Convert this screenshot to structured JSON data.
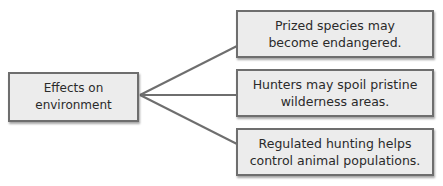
{
  "diagram": {
    "type": "tree-map",
    "root": {
      "label": "Effects on\nenvironment"
    },
    "branches": [
      {
        "label": "Prized species may\nbecome endangered."
      },
      {
        "label": "Hunters may spoil pristine\nwilderness areas."
      },
      {
        "label": "Regulated hunting helps\ncontrol animal populations."
      }
    ],
    "colors": {
      "box_fill": "#ececec",
      "box_border": "#6e6e6e",
      "connector": "#6e6e6e",
      "text": "#2a2a2a"
    }
  }
}
